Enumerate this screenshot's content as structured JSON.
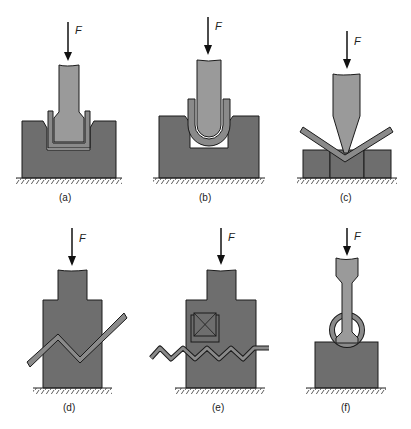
{
  "figure": {
    "force_symbol": "F",
    "colors": {
      "die": "#6e6e6e",
      "punch": "#9a9a9a",
      "sheet": "#8a8a8a",
      "outline": "#1a1a1a",
      "ground_hatch": "#333333"
    },
    "panels": [
      {
        "id": "a",
        "label": "(a)",
        "description": "U-die bending (channel die)"
      },
      {
        "id": "b",
        "label": "(b)",
        "description": "U-die bending with rounded punch"
      },
      {
        "id": "c",
        "label": "(c)",
        "description": "V-die bending"
      },
      {
        "id": "d",
        "label": "(d)",
        "description": "Offset / Z-bending"
      },
      {
        "id": "e",
        "label": "(e)",
        "description": "Corrugating"
      },
      {
        "id": "f",
        "label": "(f)",
        "description": "Curling / tube forming"
      }
    ]
  }
}
